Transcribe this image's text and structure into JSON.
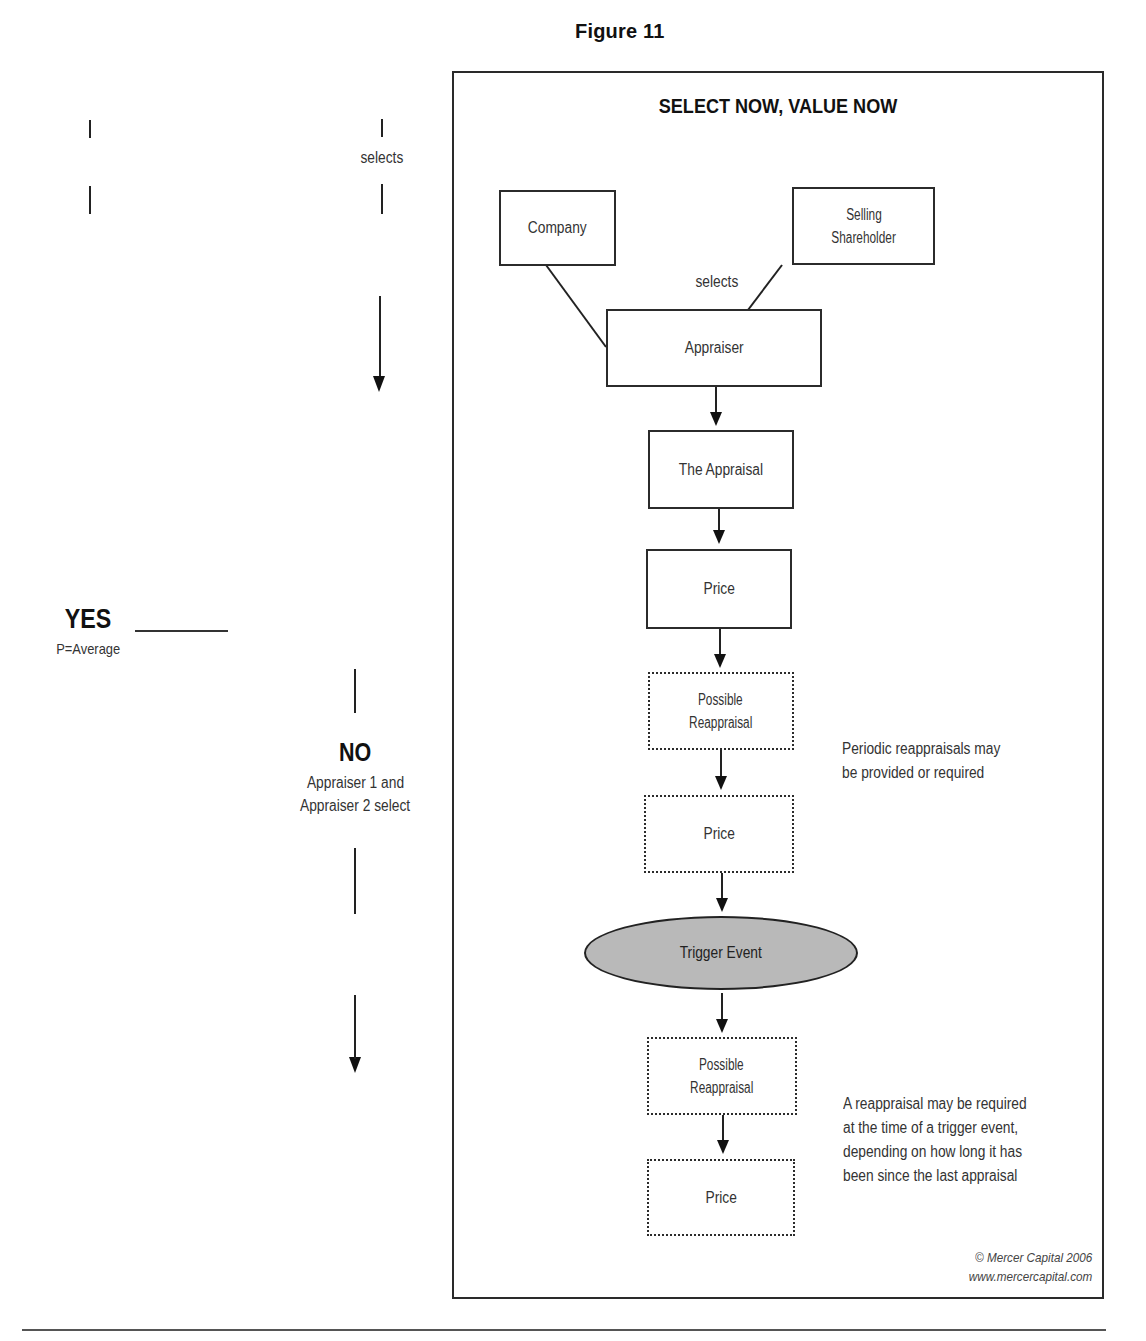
{
  "figure": {
    "label": "Figure 11",
    "title": "SELECT NOW, VALUE NOW",
    "copyright_line1": "© Mercer Capital 2006",
    "copyright_line2": "www.mercercapital.com"
  },
  "left_fragment": {
    "selects_label": "selects",
    "yes": {
      "title": "YES",
      "subtitle": "P=Average"
    },
    "no": {
      "title": "NO",
      "line1": "Appraiser 1 and",
      "line2": "Appraiser 2 select"
    }
  },
  "flowchart": {
    "nodes": [
      {
        "id": "company",
        "label": "Company",
        "style": "solid"
      },
      {
        "id": "selling_shareholder",
        "line1": "Selling",
        "line2": "Shareholder",
        "style": "solid"
      },
      {
        "id": "appraiser",
        "label": "Appraiser",
        "style": "solid"
      },
      {
        "id": "the_appraisal",
        "label": "The Appraisal",
        "style": "solid"
      },
      {
        "id": "price_1",
        "label": "Price",
        "style": "solid"
      },
      {
        "id": "possible_reappraisal_1",
        "line1": "Possible",
        "line2": "Reappraisal",
        "style": "dotted"
      },
      {
        "id": "price_2",
        "label": "Price",
        "style": "dotted"
      },
      {
        "id": "trigger_event",
        "label": "Trigger Event",
        "style": "ellipse",
        "fill": "#b9b9b9"
      },
      {
        "id": "possible_reappraisal_2",
        "line1": "Possible",
        "line2": "Reappraisal",
        "style": "dotted"
      },
      {
        "id": "price_3",
        "label": "Price",
        "style": "dotted"
      }
    ],
    "edge_label_selects": "selects",
    "edges": [
      [
        "company",
        "appraiser"
      ],
      [
        "selling_shareholder",
        "appraiser"
      ],
      [
        "appraiser",
        "the_appraisal"
      ],
      [
        "the_appraisal",
        "price_1"
      ],
      [
        "price_1",
        "possible_reappraisal_1"
      ],
      [
        "possible_reappraisal_1",
        "price_2"
      ],
      [
        "price_2",
        "trigger_event"
      ],
      [
        "trigger_event",
        "possible_reappraisal_2"
      ],
      [
        "possible_reappraisal_2",
        "price_3"
      ]
    ],
    "notes": {
      "periodic": [
        "Periodic reappraisals may",
        "be provided or required"
      ],
      "trigger": [
        "A reappraisal may be required",
        "at the time of a trigger event,",
        "depending on how long it has",
        "been since the last appraisal"
      ]
    }
  }
}
